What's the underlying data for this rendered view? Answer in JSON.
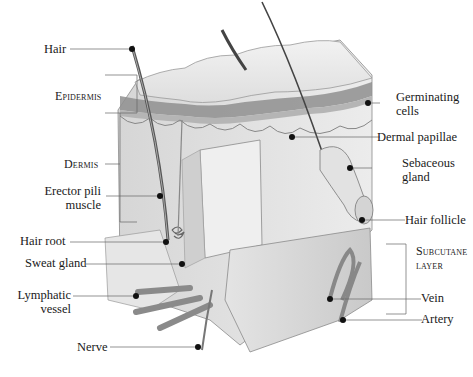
{
  "diagram": {
    "labels_left": [
      {
        "id": "hair",
        "text": "Hair"
      },
      {
        "id": "epidermis",
        "text": "Epidermis"
      },
      {
        "id": "dermis",
        "text": "Dermis"
      },
      {
        "id": "erector",
        "line1": "Erector pili",
        "line2": "muscle"
      },
      {
        "id": "hair-root",
        "text": "Hair root"
      },
      {
        "id": "sweat-gland",
        "text": "Sweat gland"
      },
      {
        "id": "lymphatic",
        "line1": "Lymphatic",
        "line2": "vessel"
      },
      {
        "id": "nerve",
        "text": "Nerve"
      }
    ],
    "labels_right": [
      {
        "id": "germinating",
        "line1": "Germinating",
        "line2": "cells"
      },
      {
        "id": "dermal-papillae",
        "text": "Dermal papillae"
      },
      {
        "id": "sebaceous",
        "line1": "Sebaceous",
        "line2": "gland"
      },
      {
        "id": "hair-follicle",
        "text": "Hair follicle"
      },
      {
        "id": "subcutaneous",
        "line1": "Subcutane",
        "line2": "layer"
      },
      {
        "id": "vein",
        "text": "Vein"
      },
      {
        "id": "artery",
        "text": "Artery"
      }
    ]
  }
}
